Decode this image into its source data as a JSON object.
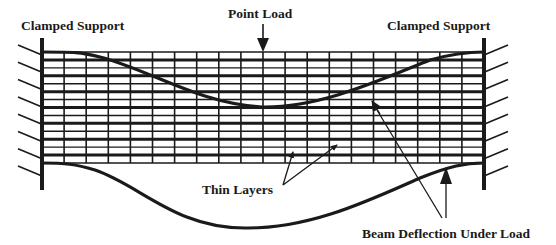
{
  "diagram": {
    "labels": {
      "left_support": "Clamped Support",
      "right_support": "Clamped Support",
      "point_load": "Point Load",
      "thin_layers": "Thin Layers",
      "beam_deflection": "Beam Deflection Under Load"
    },
    "colors": {
      "ink": "#1a1a1a",
      "background": "#ffffff"
    },
    "grid": {
      "vertical_divisions": 20,
      "horizontal_layers": 14
    },
    "components": [
      "left-clamped-support",
      "right-clamped-support",
      "layered-beam-grid",
      "point-load-arrow",
      "upper-deflection-curve",
      "lower-deflection-curve",
      "thin-layers-callout",
      "beam-deflection-callout"
    ]
  }
}
